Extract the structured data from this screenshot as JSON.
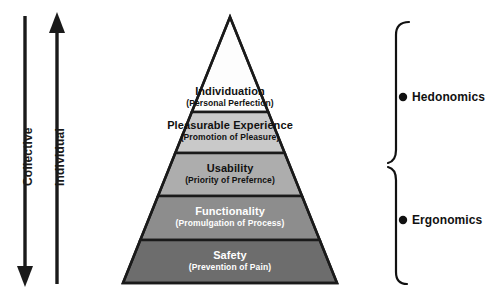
{
  "figure": {
    "background_color": "#ffffff",
    "line_color": "#1a1a1a"
  },
  "axes": {
    "left_axis": {
      "name": "collective-axis",
      "label": "Collective",
      "direction": "down",
      "arrowhead": "bottom"
    },
    "right_axis": {
      "name": "individual-axis",
      "label": "Individual",
      "direction": "up",
      "arrowhead": "top"
    }
  },
  "pyramid": {
    "apex_label": "",
    "levels": [
      {
        "index": 0,
        "name": "individuation",
        "title": "Individuation",
        "subtitle": "(Personal Perfection)",
        "fill": "#fdfdfd",
        "text_color": "#111111",
        "group": "hedonomics"
      },
      {
        "index": 1,
        "name": "pleasurable-experience",
        "title": "Pleasurable Experience",
        "subtitle": "(Promotion of Pleasure)",
        "fill": "#c9c9c9",
        "text_color": "#111111",
        "group": "hedonomics"
      },
      {
        "index": 2,
        "name": "usability",
        "title": "Usability",
        "subtitle": "(Priority of Prefernce)",
        "fill": "#adadad",
        "text_color": "#111111",
        "group": "ergonomics"
      },
      {
        "index": 3,
        "name": "functionality",
        "title": "Functionality",
        "subtitle": "(Promulgation of Process)",
        "fill": "#8d8d8d",
        "text_color": "#ffffff",
        "group": "ergonomics"
      },
      {
        "index": 4,
        "name": "safety",
        "title": "Safety",
        "subtitle": "(Prevention of Pain)",
        "fill": "#6d6d6d",
        "text_color": "#ffffff",
        "group": "ergonomics"
      }
    ]
  },
  "brackets": [
    {
      "name": "hedonomics-bracket",
      "label": "Hedonomics",
      "covers_levels": [
        "Individuation",
        "Pleasurable Experience"
      ],
      "marker": "dot"
    },
    {
      "name": "ergonomics-bracket",
      "label": "Ergonomics",
      "covers_levels": [
        "Usability",
        "Functionality",
        "Safety"
      ],
      "marker": "dot"
    }
  ]
}
